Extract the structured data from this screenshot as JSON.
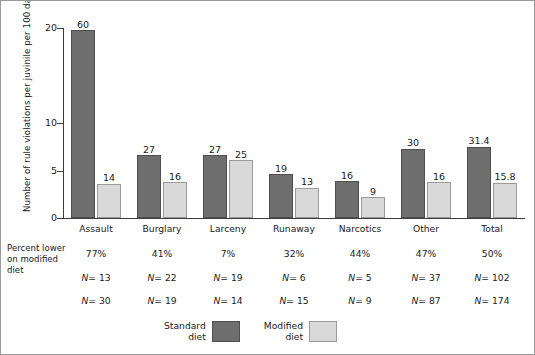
{
  "chart_data": {
    "type": "bar",
    "title": "",
    "xlabel": "",
    "ylabel": "Number of rule violations per juvinile per 100 days",
    "ylim": [
      0,
      21
    ],
    "yticks": [
      0,
      5,
      10,
      20
    ],
    "ytick_labels": [
      "0",
      "5",
      "10",
      "20"
    ],
    "grid": false,
    "legend_position": "bottom-center",
    "categories": [
      "Assault",
      "Burglary",
      "Larceny",
      "Runaway",
      "Narcotics",
      "Other",
      "Total"
    ],
    "series": [
      {
        "name": "Standard diet",
        "color": "#6e6e6e",
        "values": [
          19.8,
          6.6,
          6.6,
          4.6,
          3.9,
          7.3,
          7.5
        ],
        "point_labels": [
          "60",
          "27",
          "27",
          "19",
          "16",
          "30",
          "31.4"
        ]
      },
      {
        "name": "Modified diet",
        "color": "#d9d9d9",
        "values": [
          3.6,
          3.8,
          6.1,
          3.2,
          2.2,
          3.8,
          3.7
        ],
        "point_labels": [
          "14",
          "16",
          "25",
          "13",
          "9",
          "16",
          "15.8"
        ]
      }
    ],
    "annotations": {
      "row_title": "Percent lower\non modified\ndiet",
      "rows": [
        {
          "name": "percent-lower",
          "values": [
            "77%",
            "41%",
            "7%",
            "32%",
            "44%",
            "47%",
            "50%"
          ]
        },
        {
          "name": "n-standard",
          "values": [
            "N= 13",
            "N= 22",
            "N= 19",
            "N= 6",
            "N= 5",
            "N= 37",
            "N= 102"
          ]
        },
        {
          "name": "n-modified",
          "values": [
            "N= 30",
            "N= 19",
            "N= 14",
            "N= 15",
            "N= 9",
            "N= 87",
            "N= 174"
          ]
        }
      ]
    }
  },
  "legend": {
    "items": [
      {
        "label": "Standard\ndiet",
        "color": "#6e6e6e"
      },
      {
        "label": "Modified\ndiet",
        "color": "#d9d9d9"
      }
    ]
  }
}
